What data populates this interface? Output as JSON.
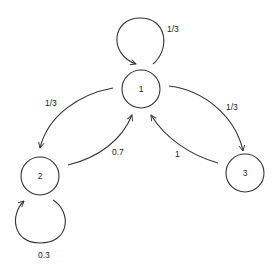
{
  "diagram": {
    "type": "markov-chain-state-diagram",
    "colors": {
      "stroke": "#333333",
      "text": "#222222",
      "background": "#ffffff"
    },
    "nodes": [
      {
        "id": "1",
        "label": "1"
      },
      {
        "id": "2",
        "label": "2"
      },
      {
        "id": "3",
        "label": "3"
      }
    ],
    "edges": [
      {
        "from": "1",
        "to": "1",
        "label": "1/3"
      },
      {
        "from": "1",
        "to": "2",
        "label": "1/3"
      },
      {
        "from": "1",
        "to": "3",
        "label": "1/3"
      },
      {
        "from": "2",
        "to": "1",
        "label": "0.7"
      },
      {
        "from": "2",
        "to": "2",
        "label": "0.3"
      },
      {
        "from": "3",
        "to": "1",
        "label": "1"
      }
    ]
  }
}
